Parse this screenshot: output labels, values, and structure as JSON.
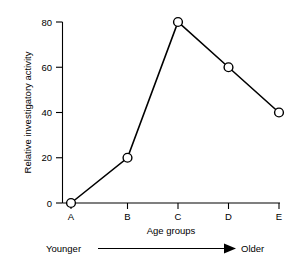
{
  "chart_data": {
    "type": "line",
    "title": "",
    "subtitle": "",
    "xlabel": "Age groups",
    "ylabel": "Relative investigatory activity",
    "categories": [
      "A",
      "B",
      "C",
      "D",
      "E"
    ],
    "values": [
      0,
      20,
      80,
      60,
      40
    ],
    "series": [
      {
        "name": "Relative investigatory activity",
        "values": [
          0,
          20,
          80,
          60,
          40
        ]
      }
    ],
    "ylim": [
      0,
      80
    ],
    "yticks": [
      0,
      20,
      40,
      60,
      80
    ],
    "ytick_labels": [
      "0",
      "20",
      "40",
      "60",
      "80"
    ],
    "xticks": [
      "A",
      "B",
      "C",
      "D",
      "E"
    ],
    "grid": false,
    "legend": "none",
    "marker": "open-circle",
    "line_color": "#000000",
    "marker_face_color": "#ffffff",
    "background_color": "#ffffff",
    "annotations": [
      {
        "name": "age-direction-arrow",
        "left_label": "Younger",
        "right_label": "Older",
        "arrow_direction": "right"
      }
    ]
  },
  "axes": {
    "y_title": "Relative investigatory activity",
    "x_title": "Age groups",
    "y_ticks": [
      {
        "value": 80,
        "label": "80"
      },
      {
        "value": 60,
        "label": "60"
      },
      {
        "value": 40,
        "label": "40"
      },
      {
        "value": 20,
        "label": "20"
      },
      {
        "value": 0,
        "label": "0"
      }
    ],
    "x_ticks": [
      {
        "key": "A",
        "label": "A"
      },
      {
        "key": "B",
        "label": "B"
      },
      {
        "key": "C",
        "label": "C"
      },
      {
        "key": "D",
        "label": "D"
      },
      {
        "key": "E",
        "label": "E"
      }
    ]
  },
  "annotation": {
    "younger_label": "Younger",
    "older_label": "Older"
  }
}
